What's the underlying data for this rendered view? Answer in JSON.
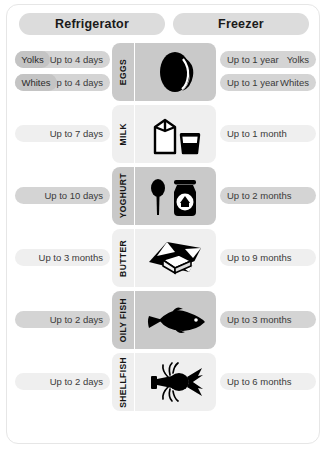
{
  "header": {
    "left_label": "Refrigerator",
    "right_label": "Freezer"
  },
  "rows": [
    {
      "name": "EGGS",
      "icon": "egg-icon",
      "shade": "dark",
      "split": true,
      "left": [
        {
          "chip": "Yolks",
          "value": "Up to 4 days"
        },
        {
          "chip": "Whites",
          "value": "Up to 4 days"
        }
      ],
      "right": [
        {
          "value": "Up to 1 year",
          "chip": "Yolks"
        },
        {
          "value": "Up to 1 year",
          "chip": "Whites"
        }
      ]
    },
    {
      "name": "MILK",
      "icon": "milk-carton-icon",
      "shade": "light",
      "split": false,
      "left_value": "Up to 7 days",
      "right_value": "Up to 1 month"
    },
    {
      "name": "YOGHURT",
      "icon": "yoghurt-jar-icon",
      "shade": "dark",
      "split": false,
      "left_value": "Up to 10 days",
      "right_value": "Up to 2 months"
    },
    {
      "name": "BUTTER",
      "icon": "butter-block-icon",
      "shade": "light",
      "split": false,
      "left_value": "Up to 3 months",
      "right_value": "Up to 9 months"
    },
    {
      "name": "OILY FISH",
      "icon": "fish-icon",
      "shade": "dark",
      "split": false,
      "left_value": "Up to 2 days",
      "right_value": "Up to 3 months"
    },
    {
      "name": "SHELLFISH",
      "icon": "lobster-icon",
      "shade": "light",
      "split": false,
      "left_value": "Up to 2 days",
      "right_value": "Up to 6 months"
    }
  ],
  "colors": {
    "pill_dark": "#d4d4d4",
    "pill_light": "#efefef",
    "header_pill": "#dcdcdc",
    "panel_dark": "#c9c9c9",
    "panel_light": "#efefef",
    "icon": "#000000"
  }
}
